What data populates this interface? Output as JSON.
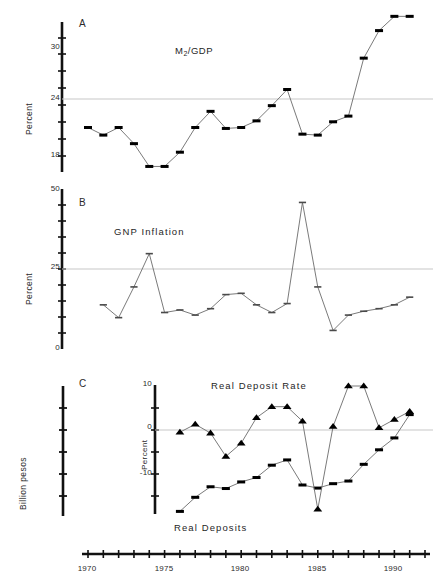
{
  "figure": {
    "background": "#ffffff",
    "line_color": "#6b6b6b",
    "marker_color": "#000000",
    "reference_line_color": "#c8c8c8",
    "axis_color": "#111111"
  },
  "panels": [
    {
      "id": "A",
      "letter": "A",
      "ylabel": "Percent",
      "series_label": "M",
      "series_label_sub": "2",
      "series_label_tail": "/GDP",
      "yticks": [
        18,
        24,
        30
      ],
      "reference_value": 24
    },
    {
      "id": "B",
      "letter": "B",
      "ylabel": "Percent",
      "series_label": "GNP Inflation",
      "yticks": [
        0,
        25,
        50
      ],
      "reference_value": 25
    },
    {
      "id": "C",
      "letter": "C",
      "ylabel_outer": "Billion pesos",
      "ylabel_inner": "Percent",
      "series_label_top": "Real Deposit Rate",
      "series_label_bottom": "Real Deposits",
      "yticks": [
        -10,
        0,
        10
      ],
      "reference_value": 0
    }
  ],
  "xaxis": {
    "ticklabels": [
      "1970",
      "1975",
      "1980",
      "1985",
      "1990"
    ],
    "tickvalues": [
      1970,
      1975,
      1980,
      1985,
      1990
    ],
    "range": [
      1970,
      1992
    ]
  },
  "chart_data": [
    {
      "type": "line",
      "panel": "A",
      "title": "M2/GDP",
      "xlabel": "",
      "ylabel": "Percent",
      "ylim": [
        15,
        33
      ],
      "xlim": [
        1970,
        1992
      ],
      "grid": false,
      "reference_line": 24,
      "legend": "none",
      "marker": "square",
      "x": [
        1970,
        1971,
        1972,
        1973,
        1974,
        1975,
        1976,
        1977,
        1978,
        1979,
        1980,
        1981,
        1982,
        1983,
        1984,
        1985,
        1986,
        1987,
        1988,
        1989,
        1990,
        1991
      ],
      "values": [
        21.0,
        20.2,
        21.0,
        19.3,
        16.9,
        16.9,
        18.4,
        21.0,
        22.7,
        20.9,
        21.0,
        21.7,
        23.3,
        25.0,
        20.3,
        20.2,
        21.6,
        22.2,
        28.3,
        31.2,
        32.7,
        32.7
      ]
    },
    {
      "type": "line",
      "panel": "B",
      "title": "GNP Inflation",
      "xlabel": "",
      "ylabel": "Percent",
      "ylim": [
        0,
        52
      ],
      "xlim": [
        1970,
        1992
      ],
      "grid": false,
      "reference_line": 25,
      "legend": "none",
      "marker": "dash",
      "x": [
        1971,
        1972,
        1973,
        1974,
        1975,
        1976,
        1977,
        1978,
        1979,
        1980,
        1981,
        1982,
        1983,
        1984,
        1985,
        1986,
        1987,
        1988,
        1989,
        1990,
        1991
      ],
      "values": [
        11.0,
        6.0,
        18.0,
        31.0,
        8.0,
        9.0,
        7.0,
        9.5,
        15.0,
        15.5,
        11.0,
        8.0,
        11.5,
        51.0,
        18.0,
        1.0,
        7.0,
        8.5,
        9.5,
        11.0,
        14.0
      ]
    },
    {
      "type": "line",
      "panel": "C",
      "title": "Real Deposit Rate",
      "xlabel": "",
      "ylabel": "Percent",
      "ylim": [
        -20,
        11
      ],
      "xlim": [
        1976,
        1992
      ],
      "grid": false,
      "reference_line": 0,
      "legend": "inline",
      "series": [
        {
          "name": "Real Deposit Rate",
          "marker": "triangle",
          "x": [
            1976,
            1977,
            1978,
            1979,
            1980,
            1981,
            1982,
            1983,
            1984,
            1985,
            1986,
            1987,
            1988,
            1989,
            1990,
            1991
          ],
          "values": [
            -0.5,
            1.3,
            -0.7,
            -6.0,
            -3.0,
            2.8,
            5.3,
            5.3,
            2.0,
            -18.0,
            0.8,
            10.0,
            10.0,
            0.5,
            2.4,
            4.2
          ]
        },
        {
          "name": "Real Deposits",
          "marker": "square",
          "x": [
            1976,
            1977,
            1978,
            1979,
            1980,
            1981,
            1982,
            1983,
            1984,
            1985,
            1986,
            1987,
            1988,
            1989,
            1990,
            1991
          ],
          "values": [
            -18.5,
            -15.3,
            -12.9,
            -13.3,
            -11.8,
            -10.8,
            -8.0,
            -6.8,
            -12.5,
            -13.2,
            -12.2,
            -11.6,
            -7.8,
            -4.5,
            -1.8,
            3.5
          ]
        }
      ]
    }
  ]
}
